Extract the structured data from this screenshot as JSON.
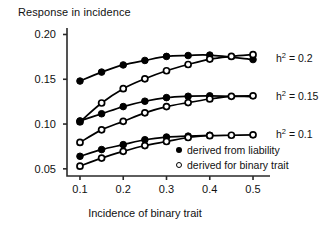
{
  "chart_data": {
    "type": "line",
    "title": "",
    "ylabel": "Response in incidence",
    "xlabel": "Incidence of binary trait",
    "xlim": [
      0.07,
      0.53
    ],
    "ylim": [
      0.042,
      0.205
    ],
    "grid": false,
    "legend_position": "inside-bottom-right",
    "xticks": [
      "0.1",
      "0.2",
      "0.3",
      "0.4",
      "0.5"
    ],
    "xtick_values": [
      0.1,
      0.2,
      0.3,
      0.4,
      0.5
    ],
    "yticks": [
      "0.20",
      "0.15",
      "0.10",
      "0.05"
    ],
    "ytick_values": [
      0.2,
      0.15,
      0.1,
      0.05
    ],
    "legend": [
      {
        "label": "derived from liability",
        "marker": "filled-circle"
      },
      {
        "label": "derived for binary trait",
        "marker": "open-circle"
      }
    ],
    "annotations": [
      {
        "text_html": "h<sup>2</sup> = 0.2",
        "text": "h2 = 0.2",
        "x": 0.52,
        "y": 0.174
      },
      {
        "text_html": "h<sup>2</sup> = 0.15",
        "text": "h2 = 0.15",
        "x": 0.52,
        "y": 0.131
      },
      {
        "text_html": "h<sup>2</sup> = 0.1",
        "text": "h2 = 0.1",
        "x": 0.52,
        "y": 0.0885
      }
    ],
    "series": [
      {
        "name": "h2 = 0.2 derived from liability",
        "group": "h2 = 0.2",
        "marker": "filled-circle",
        "x": [
          0.1,
          0.15,
          0.2,
          0.25,
          0.3,
          0.35,
          0.4,
          0.5
        ],
        "values": [
          0.148,
          0.158,
          0.166,
          0.171,
          0.1755,
          0.1765,
          0.177,
          0.172
        ],
        "marker_x": [
          0.1,
          0.15,
          0.2,
          0.25,
          0.3,
          0.35,
          0.4,
          0.5
        ]
      },
      {
        "name": "h2 = 0.2 derived for binary trait",
        "group": "h2 = 0.2",
        "marker": "open-circle",
        "x": [
          0.1,
          0.15,
          0.2,
          0.25,
          0.3,
          0.35,
          0.4,
          0.45,
          0.5
        ],
        "values": [
          0.1025,
          0.1235,
          0.1395,
          0.1505,
          0.1595,
          0.1665,
          0.1725,
          0.1755,
          0.1775
        ],
        "marker_x": [
          0.1,
          0.15,
          0.2,
          0.25,
          0.3,
          0.35,
          0.4,
          0.45,
          0.5
        ]
      },
      {
        "name": "h2 = 0.15 derived from liability",
        "group": "h2 = 0.15",
        "marker": "filled-circle",
        "x": [
          0.1,
          0.15,
          0.2,
          0.25,
          0.3,
          0.35,
          0.4,
          0.5
        ],
        "values": [
          0.1035,
          0.1115,
          0.1195,
          0.1255,
          0.1295,
          0.131,
          0.1315,
          0.1305
        ],
        "marker_x": [
          0.1,
          0.15,
          0.2,
          0.25,
          0.3,
          0.35,
          0.4
        ]
      },
      {
        "name": "h2 = 0.15 derived for binary trait",
        "group": "h2 = 0.15",
        "marker": "open-circle",
        "x": [
          0.1,
          0.15,
          0.2,
          0.25,
          0.3,
          0.35,
          0.4,
          0.45,
          0.5
        ],
        "values": [
          0.0795,
          0.0935,
          0.103,
          0.1125,
          0.1195,
          0.124,
          0.128,
          0.131,
          0.1315
        ],
        "marker_x": [
          0.1,
          0.15,
          0.2,
          0.25,
          0.3,
          0.35,
          0.4,
          0.45,
          0.5
        ]
      },
      {
        "name": "h2 = 0.1 derived from liability",
        "group": "h2 = 0.1",
        "marker": "filled-circle",
        "x": [
          0.1,
          0.15,
          0.2,
          0.25,
          0.3,
          0.35,
          0.4
        ],
        "values": [
          0.064,
          0.0715,
          0.077,
          0.0825,
          0.0855,
          0.0865,
          0.0875
        ],
        "marker_x": [
          0.1,
          0.15,
          0.2,
          0.25,
          0.3,
          0.35,
          0.4
        ]
      },
      {
        "name": "h2 = 0.1 derived for binary trait",
        "group": "h2 = 0.1",
        "marker": "open-circle",
        "x": [
          0.1,
          0.15,
          0.2,
          0.25,
          0.3,
          0.35,
          0.4,
          0.45,
          0.5
        ],
        "values": [
          0.053,
          0.062,
          0.0695,
          0.076,
          0.0805,
          0.085,
          0.087,
          0.0875,
          0.088
        ],
        "marker_x": [
          0.1,
          0.15,
          0.2,
          0.25,
          0.3,
          0.35,
          0.4,
          0.45,
          0.5
        ]
      }
    ],
    "colors": {
      "line": "#000000",
      "marker_fill": "#000000",
      "marker_open_fill": "#ffffff",
      "axis": "#2a2a2a",
      "background": "#ffffff"
    }
  }
}
